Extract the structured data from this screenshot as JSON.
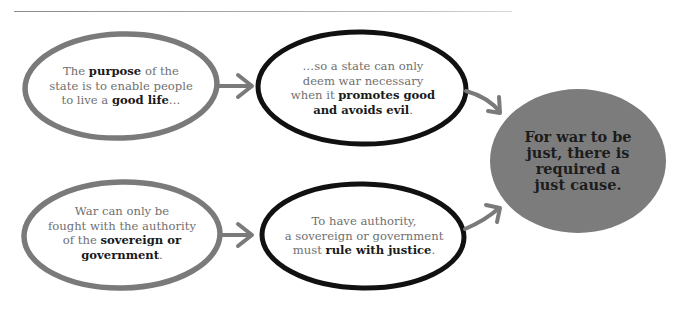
{
  "diagram": {
    "colors": {
      "grey_outline": "#7a7a7a",
      "black_outline": "#111111",
      "arrow": "#7a7a7a",
      "center_fill": "#7c7c7c",
      "body_text": "#6f6f6f",
      "bold_text": "#1a1a1a"
    },
    "nodes": [
      {
        "id": "purpose",
        "outline": "grey",
        "segments": [
          {
            "text": "The ",
            "bold": false
          },
          {
            "text": "purpose",
            "bold": true
          },
          {
            "text": " of the state is to enable people to live a ",
            "bold": false
          },
          {
            "text": "good life",
            "bold": true
          },
          {
            "text": "…",
            "bold": false
          }
        ],
        "lines": [
          [
            {
              "text": "The ",
              "bold": false
            },
            {
              "text": "purpose",
              "bold": true
            },
            {
              "text": " of the",
              "bold": false
            }
          ],
          [
            {
              "text": "state is to enable people",
              "bold": false
            }
          ],
          [
            {
              "text": "to live a ",
              "bold": false
            },
            {
              "text": "good life",
              "bold": true
            },
            {
              "text": "…",
              "bold": false
            }
          ]
        ]
      },
      {
        "id": "promotes-good",
        "outline": "black",
        "lines": [
          [
            {
              "text": "…so a state can only",
              "bold": false
            }
          ],
          [
            {
              "text": "deem war necessary",
              "bold": false
            }
          ],
          [
            {
              "text": "when it ",
              "bold": false
            },
            {
              "text": "promotes good",
              "bold": true
            }
          ],
          [
            {
              "text": "and avoids evil",
              "bold": true
            },
            {
              "text": ".",
              "bold": false
            }
          ]
        ]
      },
      {
        "id": "authority",
        "outline": "grey",
        "lines": [
          [
            {
              "text": "War can only be",
              "bold": false
            }
          ],
          [
            {
              "text": "fought with the authority",
              "bold": false
            }
          ],
          [
            {
              "text": "of the ",
              "bold": false
            },
            {
              "text": "sovereign or",
              "bold": true
            }
          ],
          [
            {
              "text": "government",
              "bold": true
            },
            {
              "text": ".",
              "bold": false
            }
          ]
        ]
      },
      {
        "id": "justice",
        "outline": "black",
        "lines": [
          [
            {
              "text": "To have authority,",
              "bold": false
            }
          ],
          [
            {
              "text": "a sovereign or government",
              "bold": false
            }
          ],
          [
            {
              "text": "must ",
              "bold": false
            },
            {
              "text": "rule with justice",
              "bold": true
            },
            {
              "text": ".",
              "bold": false
            }
          ]
        ]
      }
    ],
    "conclusion": {
      "id": "just-cause",
      "lines": [
        "For war to be",
        "just, there is",
        "required a",
        "just cause."
      ]
    },
    "edges": [
      {
        "from": "purpose",
        "to": "promotes-good"
      },
      {
        "from": "authority",
        "to": "justice"
      },
      {
        "from": "promotes-good",
        "to": "just-cause"
      },
      {
        "from": "justice",
        "to": "just-cause"
      }
    ]
  }
}
